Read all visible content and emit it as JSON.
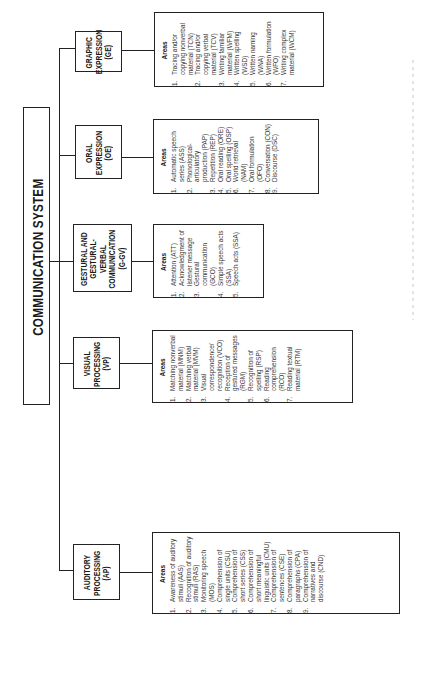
{
  "title": "COMMUNICATION SYSTEM",
  "areas_label": "Areas",
  "categories": [
    {
      "id": "AP",
      "name_lines": [
        "AUDITORY",
        "PROCESSING",
        "(AP)"
      ],
      "areas": [
        {
          "num": "1.",
          "text": "Awareness of auditory stimuli (AAS)"
        },
        {
          "num": "2.",
          "text": "Recognition of auditory stimuli (RAS)"
        },
        {
          "num": "3.",
          "text": "Monitoring speech (MOS)"
        },
        {
          "num": "4.",
          "text": "Comprehension of single units (CSU)"
        },
        {
          "num": "5.",
          "text": "Comprehension of short series (CSS)"
        },
        {
          "num": "6.",
          "text": "Comprehension of short meaningful linguistic units (CMU)"
        },
        {
          "num": "7.",
          "text": "Comprehension of sentences (CSE)"
        },
        {
          "num": "8.",
          "text": "Comprehension of paragraphs (CPA)"
        },
        {
          "num": "9.",
          "text": "Comprehension of narratives and discourse (CND)"
        }
      ]
    },
    {
      "id": "VP",
      "name_lines": [
        "VISUAL",
        "PROCESSING",
        "(VP)"
      ],
      "areas": [
        {
          "num": "1.",
          "text": "Matching nonverbal material (MNM)"
        },
        {
          "num": "2.",
          "text": "Matching verbal material (MVM)"
        },
        {
          "num": "3.",
          "text": "Visual correspondence/ recognition (VCO)"
        },
        {
          "num": "4.",
          "text": "Reception of gestured messages (RGM)"
        },
        {
          "num": "5.",
          "text": "Recognition of spelling (RSP)"
        },
        {
          "num": "6.",
          "text": "Reading comprehension (RCO)"
        },
        {
          "num": "7.",
          "text": "Reading textual material (RTM)"
        }
      ]
    },
    {
      "id": "G-GV",
      "name_lines": [
        "GESTURAL and",
        "GESTURAL-VERBAL",
        "COMMUNICATION",
        "(G-GV)"
      ],
      "areas": [
        {
          "num": "1.",
          "text": "Attention (ATT)"
        },
        {
          "num": "2.",
          "text": "Acknowledgment of listener message"
        },
        {
          "num": "3.",
          "text": "Gestural communication (GCO)"
        },
        {
          "num": "4.",
          "text": "Simple speech acts (SSA)"
        },
        {
          "num": "5.",
          "text": "Speech acts (SSA)"
        }
      ]
    },
    {
      "id": "OE",
      "name_lines": [
        "ORAL",
        "EXPRESSION",
        "(OE)"
      ],
      "areas": [
        {
          "num": "1.",
          "text": "Automatic speech series (ASS)"
        },
        {
          "num": "2.",
          "text": "Phonological-articulatory production (PAP)"
        },
        {
          "num": "3.",
          "text": "Repetition (REP)"
        },
        {
          "num": "4.",
          "text": "Oral reading (ORE)"
        },
        {
          "num": "5.",
          "text": "Oral spelling (OSP)"
        },
        {
          "num": "6.",
          "text": "World retrieval (NAM)"
        },
        {
          "num": "7.",
          "text": "Oral formulation (OFO)"
        },
        {
          "num": "8.",
          "text": "Conversation (CON)"
        },
        {
          "num": "9.",
          "text": "Discourse (DSC)"
        }
      ]
    },
    {
      "id": "GE",
      "name_lines": [
        "GRAPHIC",
        "EXPRESSION",
        "(GE)"
      ],
      "areas": [
        {
          "num": "1.",
          "text": "Tracing and/or copying nonverbal material (TCN)"
        },
        {
          "num": "2.",
          "text": "Tracing and/or copying verbal material (TCV)"
        },
        {
          "num": "3.",
          "text": "Writing familiar material (WFM)"
        },
        {
          "num": "4.",
          "text": "Written spelling (WSD)"
        },
        {
          "num": "5.",
          "text": "Written naming (WNA)"
        },
        {
          "num": "6.",
          "text": "Written formulation (WFO)"
        },
        {
          "num": "7.",
          "text": "Writing complex material (WCM)"
        }
      ]
    }
  ]
}
